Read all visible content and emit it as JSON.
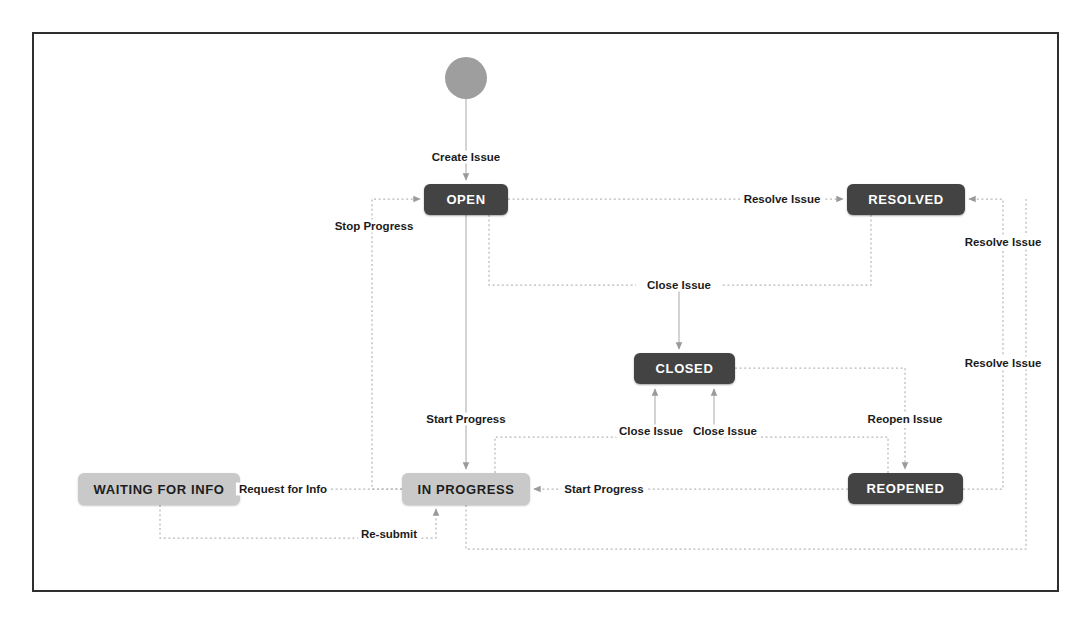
{
  "diagram": {
    "colors": {
      "frame_border": "#2f2f2f",
      "node_dark_bg": "#434343",
      "node_dark_text": "#ffffff",
      "node_light_bg": "#c9c9c9",
      "node_light_text": "#1d1d1d",
      "edge_line": "#b3b3b3",
      "arrow_head": "#9a9a9a",
      "start_node": "#9e9e9e",
      "background": "#ffffff",
      "label_text": "#1b1b1b"
    },
    "start_node": {
      "name": "start",
      "shape": "circle",
      "cx": 466,
      "cy": 78,
      "r": 21
    },
    "nodes": [
      {
        "id": "open",
        "label": "OPEN",
        "style": "dark",
        "x": 424,
        "y": 184,
        "w": 84,
        "h": 31
      },
      {
        "id": "resolved",
        "label": "RESOLVED",
        "style": "dark",
        "x": 847,
        "y": 184,
        "w": 118,
        "h": 31
      },
      {
        "id": "closed",
        "label": "CLOSED",
        "style": "dark",
        "x": 634,
        "y": 353,
        "w": 101,
        "h": 31
      },
      {
        "id": "inprogress",
        "label": "IN PROGRESS",
        "style": "light",
        "x": 402,
        "y": 473,
        "w": 128,
        "h": 32
      },
      {
        "id": "reopened",
        "label": "REOPENED",
        "style": "dark",
        "x": 848,
        "y": 473,
        "w": 115,
        "h": 31
      },
      {
        "id": "waiting",
        "label": "WAITING FOR INFO",
        "style": "light",
        "x": 78,
        "y": 473,
        "w": 162,
        "h": 32
      }
    ],
    "edges": [
      {
        "id": "create-issue",
        "label": "Create Issue",
        "from": "start",
        "to": "open",
        "label_x": 466,
        "label_y": 157
      },
      {
        "id": "open-resolve",
        "label": "Resolve Issue",
        "from": "open",
        "to": "resolved",
        "label_x": 782,
        "label_y": 199
      },
      {
        "id": "open-close",
        "label": "Close Issue",
        "from": "open",
        "to": "closed",
        "label_x": 679,
        "label_y": 285
      },
      {
        "id": "open-start",
        "label": "Start Progress",
        "from": "open",
        "to": "inprogress",
        "label_x": 466,
        "label_y": 419
      },
      {
        "id": "inprogress-stop",
        "label": "Stop Progress",
        "from": "inprogress",
        "to": "open",
        "label_x": 374,
        "label_y": 226
      },
      {
        "id": "inprogress-request",
        "label": "Request for Info",
        "from": "inprogress",
        "to": "waiting",
        "label_x": 283,
        "label_y": 489
      },
      {
        "id": "waiting-resubmit",
        "label": "Re-submit",
        "from": "waiting",
        "to": "inprogress",
        "label_x": 389,
        "label_y": 534
      },
      {
        "id": "inprogress-close",
        "label": "Close Issue",
        "from": "inprogress",
        "to": "closed",
        "label_x": 651,
        "label_y": 431
      },
      {
        "id": "reopened-close",
        "label": "Close Issue",
        "from": "reopened",
        "to": "closed",
        "label_x": 725,
        "label_y": 431
      },
      {
        "id": "inprogress-resolve",
        "label": "Resolve Issue",
        "from": "inprogress",
        "to": "resolved",
        "label_x": 1003,
        "label_y": 363
      },
      {
        "id": "reopened-resolve",
        "label": "Resolve Issue",
        "from": "reopened",
        "to": "resolved",
        "label_x": 1003,
        "label_y": 242
      },
      {
        "id": "closed-reopen",
        "label": "Reopen Issue",
        "from": "closed",
        "to": "reopened",
        "label_x": 905,
        "label_y": 419
      },
      {
        "id": "reopened-start",
        "label": "Start Progress",
        "from": "reopened",
        "to": "inprogress",
        "label_x": 604,
        "label_y": 489
      }
    ]
  }
}
